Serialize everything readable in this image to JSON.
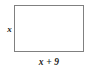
{
  "figure": {
    "type": "geometry-diagram",
    "shape": "rectangle",
    "labels": {
      "height": "x",
      "width": "x + 9"
    },
    "colors": {
      "border": "#808080",
      "fill": "#ffffff",
      "text": "#1a1a1a",
      "background": "#ffffff"
    },
    "geometry": {
      "left": 14,
      "top": 5,
      "width": 70,
      "height": 47
    }
  }
}
